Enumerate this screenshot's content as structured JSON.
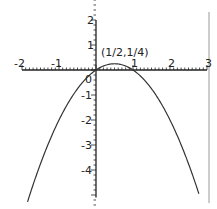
{
  "chart_data": {
    "type": "line",
    "title": "",
    "function": "y = x - x^2",
    "xlabel": "",
    "ylabel": "",
    "xlim": [
      -2,
      3
    ],
    "ylim": [
      -5,
      2
    ],
    "grid": false,
    "x_ticks": [
      "-2",
      "-1",
      "1",
      "2",
      "3"
    ],
    "y_ticks": [
      "2",
      "1",
      "-1",
      "-2",
      "-3",
      "-4"
    ],
    "origin_label": "0",
    "annotations": [
      {
        "text": "(1/2,1/4)",
        "x": 0.5,
        "y": 0.25
      }
    ],
    "series": [
      {
        "name": "parabola",
        "x": [
          -1.85,
          -1.5,
          -1,
          -0.5,
          0,
          0.5,
          1,
          1.5,
          2,
          2.5,
          2.78
        ],
        "y": [
          -5.27,
          -3.75,
          -2,
          -0.75,
          0,
          0.25,
          0,
          -0.75,
          -2,
          -3.75,
          -4.95
        ]
      }
    ],
    "colors": {
      "curve": "#333333",
      "axis": "#222222",
      "border": "#999999"
    }
  }
}
